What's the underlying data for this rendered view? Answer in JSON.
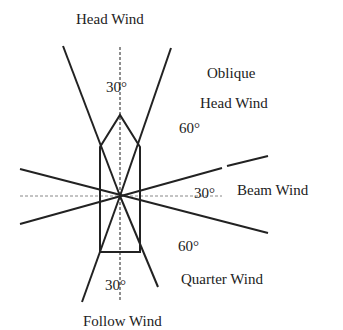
{
  "labels": {
    "head_wind": "Head Wind",
    "oblique_line1": "Oblique",
    "oblique_line2": "Head Wind",
    "beam_wind": "Beam Wind",
    "quarter_wind": "Quarter Wind",
    "follow_wind": "Follow Wind"
  },
  "angles": {
    "head": "30°",
    "oblique": "60°",
    "beam": "30°",
    "quarter": "60°",
    "follow": "30°"
  },
  "colors": {
    "line": "#222222",
    "dashed": "#666666"
  }
}
